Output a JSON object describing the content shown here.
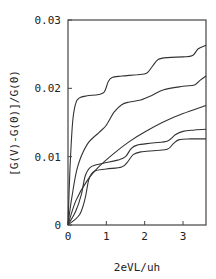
{
  "chart_data": {
    "type": "line",
    "title": "",
    "xlabel": "2eVL/uh",
    "ylabel": "[G(V)-G(0)]/G(0)",
    "xlim": [
      0,
      3.6
    ],
    "ylim": [
      0,
      0.03
    ],
    "xticks": [
      0,
      1,
      2,
      3
    ],
    "xtick_labels": [
      "0",
      "1",
      "2",
      "3"
    ],
    "yticks": [
      0,
      0.01,
      0.02,
      0.03
    ],
    "ytick_labels": [
      "0",
      "0.01",
      "0.02",
      "0.03"
    ],
    "grid": false,
    "legend": null,
    "series": [
      {
        "name": "curve-1",
        "x": [
          0,
          0.05,
          0.12,
          0.2,
          0.3,
          0.5,
          0.8,
          0.95,
          1.05,
          1.15,
          1.4,
          1.8,
          2.05,
          2.2,
          2.35,
          2.6,
          3.0,
          3.25,
          3.4,
          3.6
        ],
        "y": [
          0,
          0.008,
          0.015,
          0.0178,
          0.0186,
          0.0189,
          0.0191,
          0.0195,
          0.021,
          0.0216,
          0.0218,
          0.022,
          0.0222,
          0.0232,
          0.0242,
          0.0245,
          0.0246,
          0.0248,
          0.0258,
          0.0263
        ]
      },
      {
        "name": "curve-2",
        "x": [
          0,
          0.1,
          0.25,
          0.5,
          0.8,
          1.0,
          1.2,
          1.4,
          1.6,
          1.9,
          2.2,
          2.5,
          3.0,
          3.3,
          3.45,
          3.6
        ],
        "y": [
          0,
          0.004,
          0.0085,
          0.0118,
          0.0135,
          0.0146,
          0.0165,
          0.0176,
          0.018,
          0.0183,
          0.019,
          0.0198,
          0.0203,
          0.0205,
          0.0212,
          0.0218
        ]
      },
      {
        "name": "curve-3",
        "x": [
          0,
          0.2,
          0.5,
          0.8,
          1.2,
          1.6,
          2.0,
          2.5,
          3.0,
          3.6
        ],
        "y": [
          0,
          0.0035,
          0.0065,
          0.0085,
          0.0105,
          0.0122,
          0.0136,
          0.0151,
          0.0163,
          0.0175
        ]
      },
      {
        "name": "curve-4",
        "x": [
          0,
          0.2,
          0.35,
          0.45,
          0.6,
          0.9,
          1.3,
          1.5,
          1.65,
          1.8,
          2.2,
          2.6,
          2.8,
          3.0,
          3.3,
          3.6
        ],
        "y": [
          0,
          0.002,
          0.0045,
          0.0072,
          0.0085,
          0.009,
          0.0095,
          0.01,
          0.0112,
          0.0117,
          0.012,
          0.0123,
          0.0132,
          0.0137,
          0.0139,
          0.014
        ]
      },
      {
        "name": "curve-5",
        "x": [
          0,
          0.3,
          0.45,
          0.55,
          0.7,
          1.0,
          1.4,
          1.55,
          1.7,
          1.9,
          2.3,
          2.6,
          2.75,
          2.9,
          3.2,
          3.6
        ],
        "y": [
          0,
          0.0015,
          0.004,
          0.0068,
          0.0079,
          0.0082,
          0.0085,
          0.0092,
          0.0103,
          0.0107,
          0.0109,
          0.0111,
          0.0119,
          0.0125,
          0.0126,
          0.0126
        ]
      }
    ]
  },
  "plot": {
    "x_axis_title": "2eVL/uh",
    "y_axis_title": "[G(V)-G(0)]/G(0)",
    "line_color": "#333333",
    "axis_color": "#444444"
  }
}
